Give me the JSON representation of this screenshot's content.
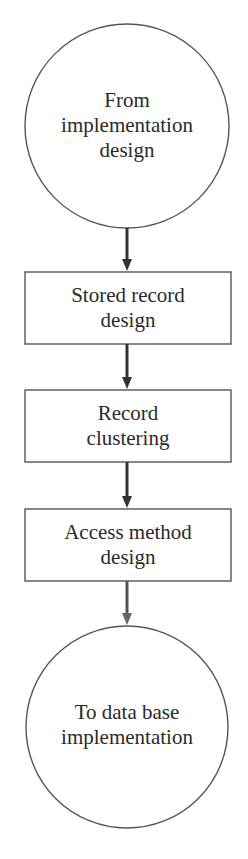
{
  "diagram": {
    "type": "flowchart",
    "direction": "top-to-bottom",
    "colors": {
      "stroke": "#555555",
      "arrow": "#333333",
      "text": "#2a2a2a",
      "background": "#ffffff"
    },
    "nodes": [
      {
        "id": "start",
        "shape": "circle",
        "lines": [
          "From",
          "implementation",
          "design"
        ]
      },
      {
        "id": "stored-record-design",
        "shape": "rectangle",
        "lines": [
          "Stored record",
          "design"
        ]
      },
      {
        "id": "record-clustering",
        "shape": "rectangle",
        "lines": [
          "Record",
          "clustering"
        ]
      },
      {
        "id": "access-method-design",
        "shape": "rectangle",
        "lines": [
          "Access method",
          "design"
        ]
      },
      {
        "id": "end",
        "shape": "circle",
        "lines": [
          "To data base",
          "implementation"
        ]
      }
    ],
    "edges": [
      {
        "from": "start",
        "to": "stored-record-design"
      },
      {
        "from": "stored-record-design",
        "to": "record-clustering"
      },
      {
        "from": "record-clustering",
        "to": "access-method-design"
      },
      {
        "from": "access-method-design",
        "to": "end"
      }
    ]
  }
}
